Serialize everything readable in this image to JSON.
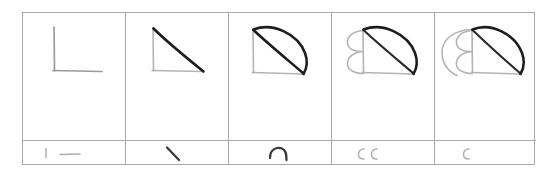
{
  "figure": {
    "kind": "hand-drawn-storyboard",
    "panel_count": 5,
    "background_color": "#ffffff",
    "frame_color": "#a8a8a8",
    "light_ink_color": "#b4b4b4",
    "dark_ink_color": "#1d1d1d"
  },
  "panels": [
    {
      "index": 1,
      "name": "panel-1",
      "drawing_description": "Light gray right-angle corner: a vertical stroke meeting a horizontal stroke, forming an L shape",
      "elements": [
        "vertical-line",
        "horizontal-line"
      ],
      "new_strokes": 2,
      "strip_glyphs": [
        "vertical-tick",
        "horizontal-dash"
      ],
      "strip_label": "| —"
    },
    {
      "index": 2,
      "name": "panel-2",
      "drawing_description": "L corner plus a bold dark diagonal from the top of the vertical to the right end of the horizontal, closing a right triangle",
      "elements": [
        "vertical-line",
        "horizontal-line",
        "diagonal-hypotenuse"
      ],
      "new_strokes": 1,
      "strip_glyphs": [
        "diagonal-stroke"
      ],
      "strip_label": "\\"
    },
    {
      "index": 3,
      "name": "panel-3",
      "drawing_description": "Triangle with a bold convex arc bulging up and right, joining the top corner to the bottom-right corner, forming a quarter-circle lobe",
      "elements": [
        "vertical-line",
        "horizontal-line",
        "diagonal-hypotenuse",
        "outer-arc"
      ],
      "new_strokes": 1,
      "strip_glyphs": [
        "arc-hook"
      ],
      "strip_label": "⌒"
    },
    {
      "index": 4,
      "name": "panel-4",
      "drawing_description": "Previous figure plus two small light semicircular arcs bulging leftward, stacked one above the other against the left edge",
      "elements": [
        "vertical-line",
        "horizontal-line",
        "diagonal-hypotenuse",
        "outer-arc",
        "left-arc-upper",
        "left-arc-lower"
      ],
      "new_strokes": 2,
      "strip_glyphs": [
        "c-arc",
        "c-arc"
      ],
      "strip_label": "c c"
    },
    {
      "index": 5,
      "name": "panel-5",
      "drawing_description": "Previous figure plus one larger light arc sweeping further out to the left, wrapping around the two small arcs like a growing spiral shell",
      "elements": [
        "vertical-line",
        "horizontal-line",
        "diagonal-hypotenuse",
        "outer-arc",
        "left-arc-upper",
        "left-arc-lower",
        "outer-left-sweep"
      ],
      "new_strokes": 1,
      "strip_glyphs": [
        "c-arc"
      ],
      "strip_label": "c"
    }
  ]
}
